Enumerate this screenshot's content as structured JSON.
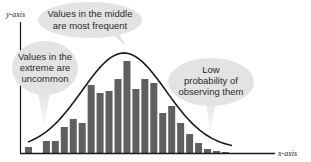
{
  "chart_data": {
    "type": "bar",
    "title": "",
    "xlabel": "x-axis",
    "ylabel": "y-axis",
    "grid": false,
    "legend": null,
    "categories": [
      "1",
      "2",
      "3",
      "4",
      "5",
      "6",
      "7",
      "8",
      "9",
      "10",
      "11",
      "12",
      "13",
      "14",
      "15",
      "16",
      "17",
      "18",
      "19",
      "20",
      "21",
      "22",
      "23"
    ],
    "values": [
      6,
      0,
      12,
      12,
      26,
      34,
      30,
      68,
      60,
      62,
      74,
      92,
      64,
      74,
      70,
      40,
      47,
      30,
      19,
      10,
      4,
      2,
      1
    ],
    "ylim": [
      0,
      100
    ],
    "overlay_curve": {
      "type": "normal-distribution",
      "description": "bell curve fitted over histogram",
      "peak_value": 100,
      "peak_category_index": 11
    },
    "annotations": [
      {
        "id": "middle",
        "text_lines": [
          "Values in the middle",
          "are most frequent"
        ]
      },
      {
        "id": "extreme",
        "text_lines": [
          "Values in the",
          "extreme are",
          "uncommon"
        ]
      },
      {
        "id": "low",
        "text_lines": [
          "Low",
          "probability of",
          "observing them"
        ]
      }
    ],
    "colors": {
      "bar": "#5f5f5f",
      "curve": "#1a1a1a",
      "axis": "#1a1a1a",
      "bubble": "#e3e3e3",
      "bubble_text": "#2a2a2a"
    }
  }
}
